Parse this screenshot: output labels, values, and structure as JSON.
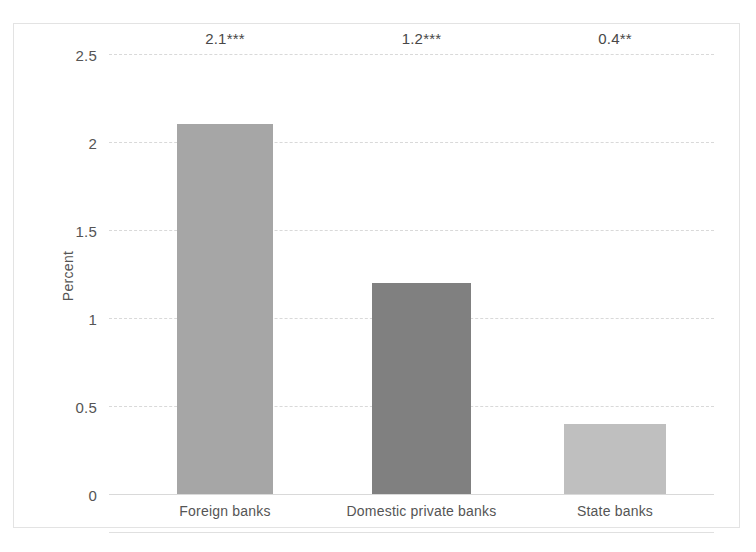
{
  "chart_data": {
    "type": "bar",
    "title": "",
    "subtitle": "",
    "xlabel": "",
    "ylabel": "Percent",
    "categories": [
      "Foreign banks",
      "Domestic private banks",
      "State banks"
    ],
    "values": [
      2.1,
      1.2,
      0.4
    ],
    "data_labels": [
      "2.1***",
      "1.2***",
      "0.4**"
    ],
    "bar_colors": [
      "#a6a6a6",
      "#808080",
      "#bfbfbf"
    ],
    "ylim": [
      0,
      2.5
    ],
    "yticks": [
      0,
      0.5,
      1,
      1.5,
      2,
      2.5
    ],
    "ytick_labels": [
      "0",
      "0.5",
      "1",
      "1.5",
      "2",
      "2.5"
    ],
    "grid": true,
    "grid_axis": "y",
    "grid_style": "dashed",
    "legend": false,
    "legend_position": "none",
    "series": [
      {
        "name": "Percent",
        "values": [
          2.1,
          1.2,
          0.4
        ]
      }
    ],
    "annotations": [
      "*** denotes significance level",
      "** denotes significance level"
    ]
  },
  "colors": {
    "gridline": "#d9d9d9",
    "axis_line": "#d9d9d9",
    "frame_border": "#e3e3e3",
    "text": "#555555",
    "label_text": "#484848",
    "background": "#ffffff"
  }
}
